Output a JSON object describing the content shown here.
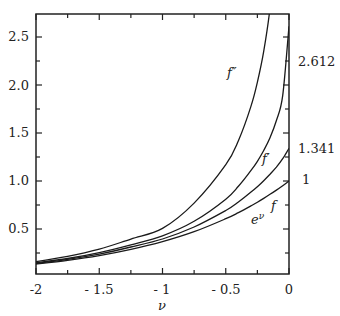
{
  "chart_data": {
    "type": "line",
    "title": "",
    "xlabel": "ν",
    "ylabel": "",
    "xlim": [
      -2,
      0
    ],
    "ylim": [
      0,
      2.75
    ],
    "grid": false,
    "legend": "inline curve labels",
    "x_ticks": [
      "-2",
      "-1.5",
      "-1",
      "-0.5",
      "0"
    ],
    "y_ticks": [
      "0.5",
      "1.0",
      "1.5",
      "2.0",
      "2.5"
    ],
    "x": [
      -2,
      -1.75,
      -1.5,
      -1.25,
      -1,
      -0.75,
      -0.5,
      -0.4,
      -0.3,
      -0.25,
      -0.2,
      -0.15,
      -0.1,
      -0.05,
      0
    ],
    "series": [
      {
        "name": "e^ν",
        "label": "e^ν",
        "values": [
          0.135,
          0.174,
          0.223,
          0.287,
          0.368,
          0.472,
          0.607,
          0.67,
          0.741,
          0.779,
          0.819,
          0.861,
          0.905,
          0.951,
          1.0
        ]
      },
      {
        "name": "f",
        "label": "f",
        "values": [
          0.142,
          0.184,
          0.239,
          0.312,
          0.396,
          0.521,
          0.693,
          0.781,
          0.884,
          0.941,
          1.003,
          1.07,
          1.144,
          1.232,
          1.341
        ]
      },
      {
        "name": "f'",
        "label": "f′",
        "values": [
          0.148,
          0.193,
          0.254,
          0.335,
          0.429,
          0.58,
          0.81,
          0.945,
          1.11,
          1.205,
          1.318,
          1.45,
          1.63,
          1.89,
          2.612
        ]
      },
      {
        "name": "f''",
        "label": "f″",
        "values": [
          0.16,
          0.215,
          0.29,
          0.395,
          0.506,
          0.77,
          1.17,
          1.42,
          1.78,
          2.03,
          2.35,
          2.8,
          3.5,
          4.8,
          null
        ]
      }
    ],
    "annotations": [
      {
        "text": "2.612",
        "at": [
          0,
          2.612
        ],
        "series": "f'"
      },
      {
        "text": "1.341",
        "at": [
          0,
          1.341
        ],
        "series": "f"
      },
      {
        "text": "1",
        "at": [
          0,
          1.0
        ],
        "series": "e^ν"
      }
    ]
  },
  "labels": {
    "xlabel": "ν",
    "x_ticks": [
      "-2",
      "- 1.5",
      "- 1",
      "- 0.5",
      "0"
    ],
    "y_ticks": [
      "0.5",
      "1.0",
      "1.5",
      "2.0",
      "2.5"
    ],
    "end_values": [
      "2.612",
      "1.341",
      "1"
    ],
    "curves": {
      "f2": "f″",
      "f1": "f′",
      "f0": "f",
      "exp": "e",
      "exp_sup": "ν"
    }
  }
}
